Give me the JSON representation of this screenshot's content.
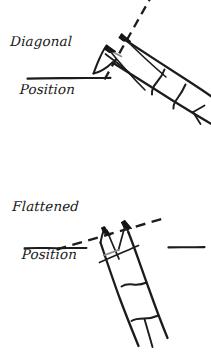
{
  "figure": {
    "background_color": "#ffffff",
    "ink_color": "#1a1a1a",
    "width": 211,
    "height": 355,
    "style": "hand-drawn pen sketch"
  },
  "panels": [
    {
      "id": "diagonal",
      "label_line1": "Diagonal",
      "label_line2": "Position",
      "label_full": "Diagonal Position",
      "reference_line_style": "dashed",
      "reference_line_label": "diagonal-angle-guide",
      "baseline_style": "solid",
      "baseline_label": "horizontal-baseline",
      "pencil_angle_degrees": 60,
      "pencil_direction": "tip-upper-left",
      "arrow_count": 2,
      "notes": "pencil shaft lies along the steep dashed guide line"
    },
    {
      "id": "flattened",
      "label_line1": "Flattened",
      "label_line2": "Position",
      "label_full": "Flattened Position",
      "reference_line_style": "dashed",
      "reference_line_label": "flattened-angle-guide",
      "baseline_style": "solid",
      "baseline_label": "horizontal-baseline",
      "baseline_right_label": "horizontal-baseline-right",
      "pencil_angle_degrees": 25,
      "pencil_direction": "tip-upper-left",
      "arrow_count": 2,
      "notes": "pencil shaft lies along the shallow dashed guide line"
    }
  ],
  "icons": {
    "pencil": "pencil-icon",
    "arrow": "arrowhead-icon",
    "dashed_guide": "dashed-guide-line-icon",
    "baseline": "baseline-icon"
  }
}
